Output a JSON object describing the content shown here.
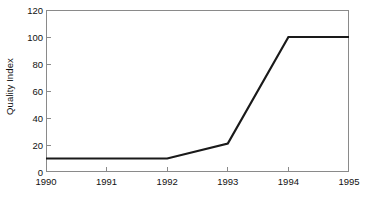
{
  "chart_data": {
    "type": "line",
    "title": "",
    "subtitle": "",
    "xlabel": "",
    "ylabel": "Quality Index",
    "x": [
      1990,
      1991,
      1992,
      1993,
      1994,
      1995
    ],
    "categories": [
      "1990",
      "1991",
      "1992",
      "1993",
      "1994",
      "1995"
    ],
    "values": [
      10,
      10,
      10,
      21,
      100,
      100
    ],
    "series": [
      {
        "name": "Quality Index",
        "values": [
          10,
          10,
          10,
          21,
          100,
          100
        ],
        "color": "#1a1a1a"
      }
    ],
    "xlim": [
      1990,
      1995
    ],
    "ylim": [
      0,
      120
    ],
    "xticks": [
      1990,
      1991,
      1992,
      1993,
      1994,
      1995
    ],
    "yticks": [
      0,
      20,
      40,
      60,
      80,
      100,
      120
    ],
    "xtick_labels": [
      "1990",
      "1991",
      "1992",
      "1993",
      "1994",
      "1995"
    ],
    "ytick_labels": [
      "0",
      "20",
      "40",
      "60",
      "80",
      "100",
      "120"
    ],
    "grid": false,
    "legend": false,
    "legend_position": "none",
    "annotations": [],
    "frame": true,
    "tick_direction": "in",
    "axis_color": "#8a8a8a",
    "text_color": "#111111",
    "background_color": "#ffffff"
  }
}
